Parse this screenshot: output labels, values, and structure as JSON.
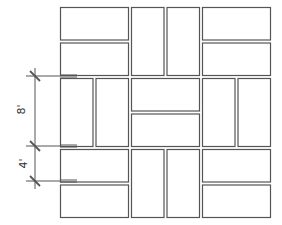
{
  "diagram": {
    "type": "basketweave-paving-pattern",
    "stroke_color": "#555555",
    "background": "#ffffff",
    "pattern": {
      "origin": [
        60,
        7
      ],
      "block_size": 68,
      "block_gap": 3,
      "brick_gap": 3,
      "grid": [
        [
          "horizontal",
          "vertical",
          "horizontal"
        ],
        [
          "vertical",
          "horizontal",
          "vertical"
        ],
        [
          "horizontal",
          "vertical",
          "horizontal"
        ]
      ]
    },
    "dimensions": [
      {
        "label": "8'",
        "from_y": 76,
        "to_y": 146
      },
      {
        "label": "4'",
        "from_y": 146,
        "to_y": 181
      }
    ]
  }
}
